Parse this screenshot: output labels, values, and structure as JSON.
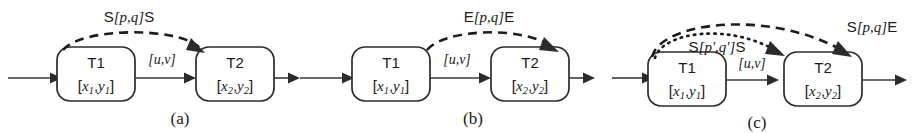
{
  "figure": {
    "background_color": "#ffffff",
    "line_color": "#2b2b2b",
    "panels": [
      {
        "caption": "(a)",
        "boxes": [
          {
            "title": "T1",
            "state_open": "[",
            "state_x": "x",
            "state_xsub": "1",
            "state_comma": ",",
            "state_y": "y",
            "state_ysub": "1",
            "state_close": "]"
          },
          {
            "title": "T2",
            "state_open": "[",
            "state_x": "x",
            "state_xsub": "2",
            "state_comma": ",",
            "state_y": "y",
            "state_ysub": "2",
            "state_close": "]"
          }
        ],
        "edge_label": "[u,v]",
        "arcs": [
          {
            "style": "dashed",
            "label_prefix": "S",
            "label_body": "[p,q]",
            "label_suffix": "S",
            "label": "S[p,q]S"
          }
        ]
      },
      {
        "caption": "(b)",
        "boxes": [
          {
            "title": "T1",
            "state_open": "[",
            "state_x": "x",
            "state_xsub": "1",
            "state_comma": ",",
            "state_y": "y",
            "state_ysub": "1",
            "state_close": "]"
          },
          {
            "title": "T2",
            "state_open": "[",
            "state_x": "x",
            "state_xsub": "2",
            "state_comma": ",",
            "state_y": "y",
            "state_ysub": "2",
            "state_close": "]"
          }
        ],
        "edge_label": "[u,v]",
        "arcs": [
          {
            "style": "dashed",
            "label_prefix": "E",
            "label_body": "[p,q]",
            "label_suffix": "E",
            "label": "E[p,q]E"
          }
        ]
      },
      {
        "caption": "(c)",
        "boxes": [
          {
            "title": "T1",
            "state_open": "[",
            "state_x": "x",
            "state_xsub": "1",
            "state_comma": ",",
            "state_y": "y",
            "state_ysub": "1",
            "state_close": "]"
          },
          {
            "title": "T2",
            "state_open": "[",
            "state_x": "x",
            "state_xsub": "2",
            "state_comma": ",",
            "state_y": "y",
            "state_ysub": "2",
            "state_close": "]"
          }
        ],
        "edge_label": "[u,v]",
        "arcs": [
          {
            "style": "dashed",
            "label_prefix": "S",
            "label_body": "[p,q]",
            "label_suffix": "E",
            "label": "S[p,q]E"
          },
          {
            "style": "dotted",
            "label_prefix": "S",
            "label_body": "[p',q']",
            "label_suffix": "S",
            "label": "S[p',q']S"
          }
        ]
      }
    ]
  }
}
